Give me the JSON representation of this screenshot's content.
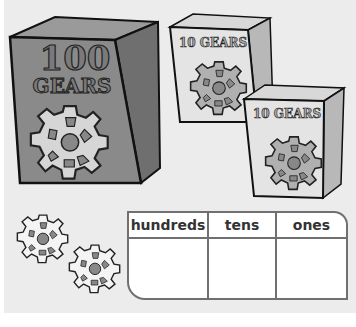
{
  "illustration": {
    "big_box": {
      "number_label": "100",
      "word_label": "GEARS",
      "color": "#8a8a8a"
    },
    "small_boxes": [
      {
        "label": "10 GEARS",
        "color": "#e4e4e4"
      },
      {
        "label": "10 GEARS",
        "color": "#e4e4e4"
      }
    ],
    "loose_gears_count": 2
  },
  "place_value_table": {
    "headers": [
      "hundreds",
      "tens",
      "ones"
    ],
    "values": [
      "",
      "",
      ""
    ]
  }
}
